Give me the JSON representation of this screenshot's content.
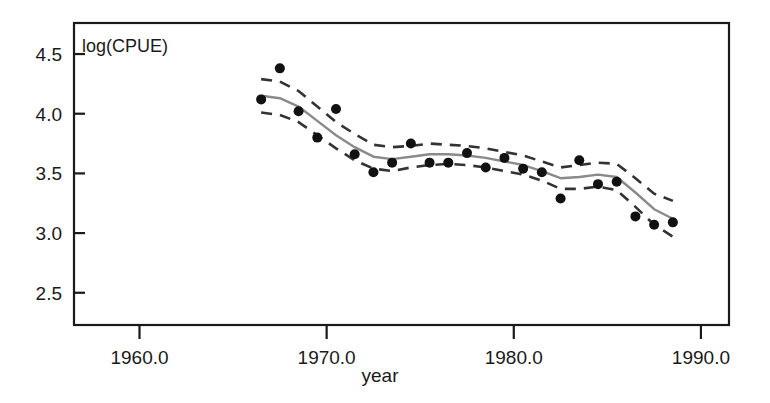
{
  "figure": {
    "background_color": "#ffffff",
    "panel_label": "log(CPUE)",
    "axis_color": "#1a1a1a"
  },
  "chart_data": {
    "type": "line",
    "title": "",
    "subtitle": "",
    "panel_annotation": "log(CPUE)",
    "xlabel": "year",
    "ylabel": "",
    "ylabel_inside": "log(CPUE)",
    "xlim": [
      1956.5,
      1991.5
    ],
    "ylim": [
      2.23,
      4.76
    ],
    "grid": false,
    "legend": null,
    "legend_position": "none",
    "xticks": [
      1960.0,
      1970.0,
      1980.0,
      1990.0
    ],
    "xtick_labels": [
      "1960.0",
      "1970.0",
      "1980.0",
      "1990.0"
    ],
    "yticks": [
      2.5,
      3.0,
      3.5,
      4.0,
      4.5
    ],
    "ytick_labels": [
      "2.5",
      "3.0",
      "3.5",
      "4.0",
      "4.5"
    ],
    "x": [
      1966.5,
      1967.5,
      1968.5,
      1969.5,
      1970.5,
      1971.5,
      1972.5,
      1973.5,
      1974.5,
      1975.5,
      1976.5,
      1977.5,
      1978.5,
      1979.5,
      1980.5,
      1981.5,
      1982.5,
      1983.5,
      1984.5,
      1985.5,
      1986.5,
      1987.5,
      1988.5
    ],
    "series": [
      {
        "name": "observed",
        "style": "points",
        "color": "#111111",
        "marker": "filled-circle",
        "values": [
          4.12,
          4.38,
          4.02,
          3.8,
          4.04,
          3.66,
          3.51,
          3.59,
          3.75,
          3.59,
          3.59,
          3.67,
          3.55,
          3.63,
          3.54,
          3.51,
          3.29,
          3.61,
          3.41,
          3.43,
          3.14,
          3.07,
          3.09
        ]
      },
      {
        "name": "fitted",
        "style": "solid-line",
        "color": "#8a8a8a",
        "values": [
          4.15,
          4.13,
          4.06,
          3.94,
          3.82,
          3.72,
          3.64,
          3.62,
          3.64,
          3.66,
          3.66,
          3.65,
          3.63,
          3.6,
          3.57,
          3.52,
          3.46,
          3.47,
          3.49,
          3.47,
          3.34,
          3.2,
          3.12
        ]
      },
      {
        "name": "upper-confidence-limit",
        "style": "dashed-line",
        "color": "#333333",
        "values": [
          4.29,
          4.27,
          4.19,
          4.06,
          3.93,
          3.83,
          3.74,
          3.72,
          3.73,
          3.75,
          3.74,
          3.73,
          3.71,
          3.68,
          3.65,
          3.6,
          3.55,
          3.57,
          3.59,
          3.58,
          3.46,
          3.33,
          3.27
        ]
      },
      {
        "name": "lower-confidence-limit",
        "style": "dashed-line",
        "color": "#333333",
        "values": [
          4.01,
          3.99,
          3.93,
          3.82,
          3.71,
          3.61,
          3.54,
          3.52,
          3.55,
          3.57,
          3.58,
          3.57,
          3.55,
          3.52,
          3.49,
          3.44,
          3.37,
          3.37,
          3.39,
          3.36,
          3.22,
          3.07,
          2.97
        ]
      }
    ]
  }
}
